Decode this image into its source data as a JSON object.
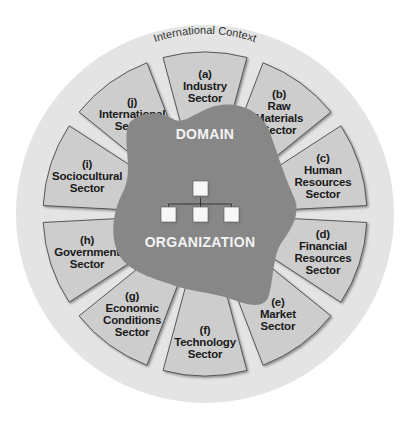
{
  "diagram": {
    "title": "International Context",
    "domain_label": "DOMAIN",
    "organization_label": "ORGANIZATION",
    "colors": {
      "outer_circle": "#e4e4e4",
      "sector_fill": "#cdcdcd",
      "sector_stroke": "#4a4a4a",
      "blob": "#878787",
      "org_box": "#f7f7f7",
      "org_line": "#333333"
    },
    "sectors": [
      {
        "id": "a",
        "letter": "(a)",
        "lines": [
          "Industry",
          "Sector"
        ]
      },
      {
        "id": "b",
        "letter": "(b)",
        "lines": [
          "Raw",
          "Materials",
          "Sector"
        ]
      },
      {
        "id": "c",
        "letter": "(c)",
        "lines": [
          "Human",
          "Resources",
          "Sector"
        ]
      },
      {
        "id": "d",
        "letter": "(d)",
        "lines": [
          "Financial",
          "Resources",
          "Sector"
        ]
      },
      {
        "id": "e",
        "letter": "(e)",
        "lines": [
          "Market",
          "Sector"
        ]
      },
      {
        "id": "f",
        "letter": "(f)",
        "lines": [
          "Technology",
          "Sector"
        ]
      },
      {
        "id": "g",
        "letter": "(g)",
        "lines": [
          "Economic",
          "Conditions",
          "Sector"
        ]
      },
      {
        "id": "h",
        "letter": "(h)",
        "lines": [
          "Government",
          "Sector"
        ]
      },
      {
        "id": "i",
        "letter": "(i)",
        "lines": [
          "Sociocultural",
          "Sector"
        ]
      },
      {
        "id": "j",
        "letter": "(j)",
        "lines": [
          "International",
          "Sector"
        ]
      }
    ],
    "org_chart": {
      "levels": [
        1,
        3
      ],
      "icon": "org-chart-icon"
    }
  }
}
